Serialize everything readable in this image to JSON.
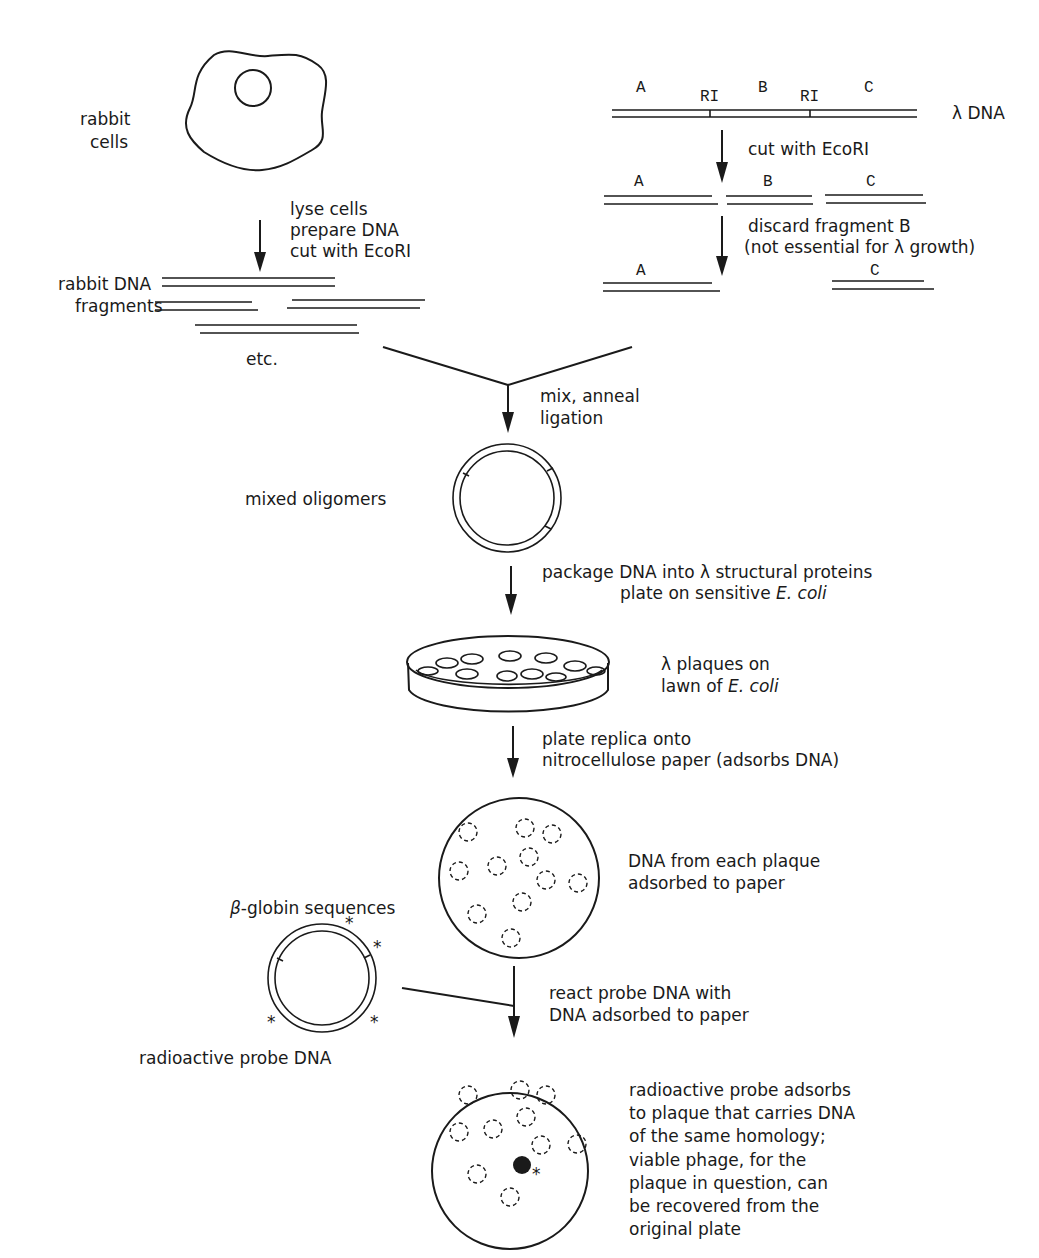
{
  "left_branch": {
    "cell_label": [
      "rabbit",
      "cells"
    ],
    "step1": [
      "lyse cells",
      "prepare DNA",
      "cut with EcoRI"
    ],
    "fragments_label": [
      "rabbit DNA",
      "fragments"
    ],
    "etc_label": "etc."
  },
  "right_branch": {
    "segment_labels": [
      "A",
      "B",
      "C"
    ],
    "site_labels": [
      "RI",
      "RI"
    ],
    "lambda_label": "λ DNA",
    "step1": "cut with EcoRI",
    "cut_labels": [
      "A",
      "B",
      "C"
    ],
    "step2": [
      "discard fragment B",
      "(not essential for λ growth)"
    ],
    "kept_labels": [
      "A",
      "C"
    ]
  },
  "merge": {
    "step": [
      "mix, anneal",
      "ligation"
    ],
    "product_label": "mixed oligomers"
  },
  "packaging": {
    "step_line1": "package DNA into λ structural proteins",
    "step_line2_prefix": "plate on sensitive ",
    "step_line2_italic": "E. coli"
  },
  "petri_dish": {
    "label_line1": "λ plaques on",
    "label_line2_prefix": "lawn of ",
    "label_line2_italic": "E. coli"
  },
  "replica": {
    "step": [
      "plate replica onto",
      "nitrocellulose paper (adsorbs DNA)"
    ],
    "filter_label": [
      "DNA from each plaque",
      "adsorbed to paper"
    ]
  },
  "probe": {
    "top_label_symbol": "β",
    "top_label_text": "-globin sequences",
    "bottom_label": "radioactive probe DNA",
    "marker": "*"
  },
  "hybridization": {
    "step": [
      "react probe DNA with",
      "DNA adsorbed to paper"
    ],
    "result_label": [
      "radioactive probe adsorbs",
      "to plaque that carries DNA",
      "of the same homology;",
      "viable phage, for the",
      "plaque in question, can",
      "be recovered from the",
      "original plate"
    ]
  },
  "colors": {
    "ink": "#1a1a1a",
    "paper": "#ffffff"
  }
}
